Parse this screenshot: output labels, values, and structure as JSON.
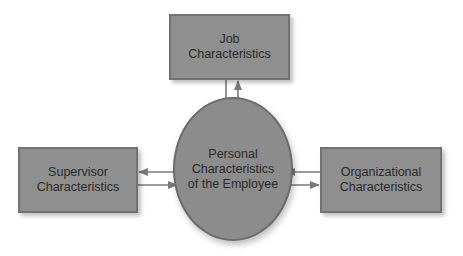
{
  "diagram": {
    "center": {
      "label": "Personal\nCharacteristics\nof the Employee"
    },
    "nodes": [
      {
        "id": "job",
        "label": "Job\nCharacteristics"
      },
      {
        "id": "supervisor",
        "label": "Supervisor\nCharacteristics"
      },
      {
        "id": "organizational",
        "label": "Organizational\nCharacteristics"
      }
    ],
    "edges": [
      {
        "from": "job",
        "to": "center"
      },
      {
        "from": "center",
        "to": "job"
      },
      {
        "from": "center",
        "to": "supervisor"
      },
      {
        "from": "supervisor",
        "to": "center"
      },
      {
        "from": "organizational",
        "to": "center"
      },
      {
        "from": "center",
        "to": "organizational"
      }
    ],
    "colors": {
      "box_fill": "#8f8f8f",
      "circle_fill": "#8c8c8c",
      "arrow": "#7a7a7a"
    }
  }
}
